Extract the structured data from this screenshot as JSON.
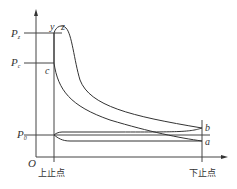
{
  "diagram": {
    "type": "engine p-V indicator diagram",
    "axes": {
      "origin_label": "O",
      "y_axis": "pressure",
      "x_axis": "volume"
    },
    "pressure_levels": [
      {
        "label": "P",
        "subscript": "z"
      },
      {
        "label": "P",
        "subscript": "c"
      },
      {
        "label": "P",
        "subscript": "0"
      }
    ],
    "points": {
      "y": "y",
      "z": "z",
      "c": "c",
      "b": "b",
      "a": "a"
    },
    "x_labels": {
      "tdc": "上止点",
      "bdc": "下止点"
    }
  }
}
